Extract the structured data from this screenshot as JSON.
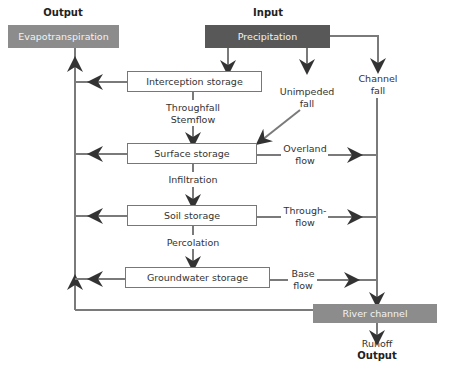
{
  "diagram": {
    "type": "flow diagram",
    "headers": {
      "output_top": "Output",
      "input_top": "Input",
      "output_bottom": "Output"
    },
    "nodes": {
      "evapotranspiration": "Evapotranspiration",
      "precipitation": "Precipitation",
      "interception": "Interception storage",
      "surface": "Surface storage",
      "soil": "Soil storage",
      "groundwater": "Groundwater storage",
      "river": "River channel"
    },
    "flows": {
      "throughfall": "Throughfall",
      "stemflow": "Stemflow",
      "infiltration": "Infiltration",
      "percolation": "Percolation",
      "unimpeded_1": "Unimpeded",
      "unimpeded_2": "fall",
      "channel_1": "Channel",
      "channel_2": "fall",
      "overland_1": "Overland",
      "overland_2": "flow",
      "through_1": "Through-",
      "through_2": "flow",
      "base_1": "Base",
      "base_2": "flow",
      "runoff": "Runoff"
    },
    "colors": {
      "line": "#7a7a7a",
      "arrowhead": "#333333",
      "evapotranspiration_fill": "#8c8c8c",
      "precipitation_fill": "#585858",
      "river_fill": "#8c8c8c"
    }
  }
}
